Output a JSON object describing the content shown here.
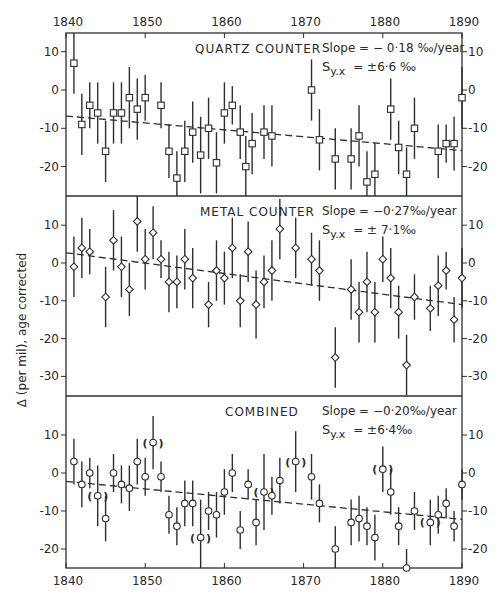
{
  "ylabel": "Δ (per mil), age corrected",
  "x_ticks_top": [
    "1840",
    "1850",
    "1860",
    "1870",
    "1880",
    "1890"
  ],
  "x_ticks_bottom": [
    "1840",
    "1850",
    "1860",
    "1870",
    "1880",
    "1890"
  ],
  "chart_data": [
    {
      "type": "scatter",
      "title": "QUARTZ COUNTER",
      "xlabel": "Year",
      "ylabel": "Δ (per mil), age corrected",
      "xlim": [
        1840,
        1890
      ],
      "ylim": [
        -27,
        15
      ],
      "yticks": [
        10,
        0,
        -10,
        -20
      ],
      "marker": "square",
      "annotations": [
        "Slope = -0·18‰/year",
        "S y.x = ±6·6‰"
      ],
      "slope_label": "Slope = − 0·18 ‰/year",
      "syx_label": "= ±6·6 ‰",
      "trend": {
        "x": [
          1840,
          1890
        ],
        "y": [
          -6.8,
          -15.8
        ]
      },
      "points": [
        {
          "x": 1841,
          "y": 7,
          "err": 8
        },
        {
          "x": 1842,
          "y": -9,
          "err": 8
        },
        {
          "x": 1843,
          "y": -4,
          "err": 6
        },
        {
          "x": 1844,
          "y": -6,
          "err": 8
        },
        {
          "x": 1845,
          "y": -16,
          "err": 8
        },
        {
          "x": 1846,
          "y": -6,
          "err": 8
        },
        {
          "x": 1847,
          "y": -6,
          "err": 8
        },
        {
          "x": 1848,
          "y": -2,
          "err": 8
        },
        {
          "x": 1849,
          "y": -5,
          "err": 8
        },
        {
          "x": 1850,
          "y": -2,
          "err": 6
        },
        {
          "x": 1852,
          "y": -4,
          "err": 6
        },
        {
          "x": 1853,
          "y": -16,
          "err": 7
        },
        {
          "x": 1854,
          "y": -23,
          "err": 7
        },
        {
          "x": 1855,
          "y": -16,
          "err": 8
        },
        {
          "x": 1856,
          "y": -11,
          "err": 8
        },
        {
          "x": 1857,
          "y": -17,
          "err": 10
        },
        {
          "x": 1858,
          "y": -10,
          "err": 8
        },
        {
          "x": 1859,
          "y": -19,
          "err": 8
        },
        {
          "x": 1860,
          "y": -6,
          "err": 8
        },
        {
          "x": 1861,
          "y": -4,
          "err": 5
        },
        {
          "x": 1862,
          "y": -11,
          "err": 7
        },
        {
          "x": 1862.7,
          "y": -20,
          "err": 8
        },
        {
          "x": 1863.5,
          "y": -14,
          "err": 8
        },
        {
          "x": 1865,
          "y": -11,
          "err": 7
        },
        {
          "x": 1866,
          "y": -12,
          "err": 8
        },
        {
          "x": 1871,
          "y": 0,
          "err": 8
        },
        {
          "x": 1872,
          "y": -13,
          "err": 8
        },
        {
          "x": 1874,
          "y": -18,
          "err": 8
        },
        {
          "x": 1876,
          "y": -18,
          "err": 8
        },
        {
          "x": 1877,
          "y": -12,
          "err": 8
        },
        {
          "x": 1878,
          "y": -24,
          "err": 8
        },
        {
          "x": 1879,
          "y": -22,
          "err": 8
        },
        {
          "x": 1881,
          "y": -5,
          "err": 8
        },
        {
          "x": 1882,
          "y": -15,
          "err": 7
        },
        {
          "x": 1883,
          "y": -22,
          "err": 7
        },
        {
          "x": 1884,
          "y": -10,
          "err": 8
        },
        {
          "x": 1887,
          "y": -16,
          "err": 7
        },
        {
          "x": 1888,
          "y": -14,
          "err": 5
        },
        {
          "x": 1889,
          "y": -14,
          "err": 7
        },
        {
          "x": 1890,
          "y": -2,
          "err": 8
        }
      ]
    },
    {
      "type": "scatter",
      "title": "METAL COUNTER",
      "xlabel": "Year",
      "ylabel": "Δ (per mil), age corrected",
      "xlim": [
        1840,
        1890
      ],
      "ylim": [
        -35,
        17
      ],
      "yticks": [
        10,
        0,
        -10,
        -20,
        -30
      ],
      "marker": "diamond",
      "slope_label": "Slope = −0·27‰/year",
      "syx_label": "= ± 7·1‰",
      "trend": {
        "x": [
          1840,
          1890
        ],
        "y": [
          2.7,
          -11.0
        ]
      },
      "points": [
        {
          "x": 1841,
          "y": -1,
          "err": 8
        },
        {
          "x": 1842,
          "y": 4,
          "err": 8
        },
        {
          "x": 1843,
          "y": 3,
          "err": 6
        },
        {
          "x": 1845,
          "y": -9,
          "err": 8
        },
        {
          "x": 1846,
          "y": 6,
          "err": 8
        },
        {
          "x": 1847,
          "y": -1,
          "err": 8
        },
        {
          "x": 1848,
          "y": -7,
          "err": 7
        },
        {
          "x": 1849,
          "y": 11,
          "err": 8
        },
        {
          "x": 1850,
          "y": 1,
          "err": 8
        },
        {
          "x": 1851,
          "y": 8,
          "err": 7
        },
        {
          "x": 1852,
          "y": 1,
          "err": 5
        },
        {
          "x": 1853,
          "y": -5,
          "err": 8
        },
        {
          "x": 1854,
          "y": -5,
          "err": 7
        },
        {
          "x": 1855,
          "y": 1,
          "err": 8
        },
        {
          "x": 1856,
          "y": -4,
          "err": 8
        },
        {
          "x": 1858,
          "y": -11,
          "err": 6
        },
        {
          "x": 1859,
          "y": -2,
          "err": 8
        },
        {
          "x": 1860,
          "y": -4,
          "err": 7
        },
        {
          "x": 1861,
          "y": 4,
          "err": 8
        },
        {
          "x": 1862,
          "y": -10,
          "err": 7
        },
        {
          "x": 1863,
          "y": 3,
          "err": 8
        },
        {
          "x": 1864,
          "y": -11,
          "err": 9
        },
        {
          "x": 1865,
          "y": -5,
          "err": 7
        },
        {
          "x": 1866,
          "y": -2,
          "err": 8
        },
        {
          "x": 1867,
          "y": 9,
          "err": 8
        },
        {
          "x": 1869,
          "y": 4,
          "err": 8
        },
        {
          "x": 1871,
          "y": 1,
          "err": 7
        },
        {
          "x": 1872,
          "y": -2,
          "err": 8
        },
        {
          "x": 1874,
          "y": -25,
          "err": 8
        },
        {
          "x": 1876,
          "y": -7,
          "err": 8
        },
        {
          "x": 1877,
          "y": -13,
          "err": 8
        },
        {
          "x": 1878,
          "y": -5,
          "err": 8
        },
        {
          "x": 1879,
          "y": -13,
          "err": 8
        },
        {
          "x": 1880,
          "y": 1,
          "err": 6
        },
        {
          "x": 1881,
          "y": -4,
          "err": 8
        },
        {
          "x": 1882,
          "y": -13,
          "err": 7
        },
        {
          "x": 1883,
          "y": -27,
          "err": 8
        },
        {
          "x": 1884,
          "y": -9,
          "err": 6
        },
        {
          "x": 1886,
          "y": -12,
          "err": 6
        },
        {
          "x": 1887,
          "y": -6,
          "err": 8
        },
        {
          "x": 1888,
          "y": -2,
          "err": 5
        },
        {
          "x": 1889,
          "y": -15,
          "err": 6
        },
        {
          "x": 1890,
          "y": -4,
          "err": 8
        }
      ]
    },
    {
      "type": "scatter",
      "title": "COMBINED",
      "xlabel": "Year",
      "ylabel": "Δ (per mil), age corrected",
      "xlim": [
        1840,
        1890
      ],
      "ylim": [
        -25,
        20
      ],
      "yticks": [
        10,
        0,
        -10,
        -20
      ],
      "xticks": [
        1840,
        1850,
        1860,
        1870,
        1880,
        1890
      ],
      "marker": "circle",
      "slope_label": "Slope = −0·20‰/year",
      "syx_label": "= ±6·4‰",
      "trend": {
        "x": [
          1840,
          1890
        ],
        "y": [
          -2.2,
          -12.2
        ]
      },
      "points": [
        {
          "x": 1841,
          "y": 3,
          "err": 6
        },
        {
          "x": 1842,
          "y": -3,
          "err": 6
        },
        {
          "x": 1843,
          "y": 0,
          "err": 4
        },
        {
          "x": 1844,
          "y": -6,
          "err": 8,
          "bracketed": true
        },
        {
          "x": 1845,
          "y": -12,
          "err": 6
        },
        {
          "x": 1846,
          "y": 0,
          "err": 5
        },
        {
          "x": 1847,
          "y": -3,
          "err": 5
        },
        {
          "x": 1848,
          "y": -4,
          "err": 6
        },
        {
          "x": 1849,
          "y": 3,
          "err": 6
        },
        {
          "x": 1850,
          "y": -1,
          "err": 5
        },
        {
          "x": 1851,
          "y": 8,
          "err": 7,
          "bracketed": true
        },
        {
          "x": 1852,
          "y": -1,
          "err": 4
        },
        {
          "x": 1853,
          "y": -11,
          "err": 5
        },
        {
          "x": 1854,
          "y": -14,
          "err": 5
        },
        {
          "x": 1855,
          "y": -8,
          "err": 6
        },
        {
          "x": 1856,
          "y": -8,
          "err": 6
        },
        {
          "x": 1857,
          "y": -17,
          "err": 10,
          "bracketed": true
        },
        {
          "x": 1858,
          "y": -10,
          "err": 5
        },
        {
          "x": 1859,
          "y": -11,
          "err": 6
        },
        {
          "x": 1860,
          "y": -5,
          "err": 6
        },
        {
          "x": 1861,
          "y": 0,
          "err": 5
        },
        {
          "x": 1862,
          "y": -15,
          "err": 5
        },
        {
          "x": 1863,
          "y": -3,
          "err": 4
        },
        {
          "x": 1864,
          "y": -13,
          "err": 6
        },
        {
          "x": 1865,
          "y": -5,
          "err": 10,
          "bracketed": true
        },
        {
          "x": 1866,
          "y": -6,
          "err": 5
        },
        {
          "x": 1867,
          "y": -2,
          "err": 6
        },
        {
          "x": 1869,
          "y": 3,
          "err": 8,
          "bracketed": true
        },
        {
          "x": 1871,
          "y": -1,
          "err": 6
        },
        {
          "x": 1872,
          "y": -8,
          "err": 5
        },
        {
          "x": 1874,
          "y": -20,
          "err": 6
        },
        {
          "x": 1876,
          "y": -13,
          "err": 6
        },
        {
          "x": 1877,
          "y": -12,
          "err": 6
        },
        {
          "x": 1878,
          "y": -14,
          "err": 5
        },
        {
          "x": 1879,
          "y": -17,
          "err": 6
        },
        {
          "x": 1880,
          "y": 1,
          "err": 6,
          "bracketed": true
        },
        {
          "x": 1881,
          "y": -5,
          "err": 6
        },
        {
          "x": 1882,
          "y": -14,
          "err": 5
        },
        {
          "x": 1883,
          "y": -25,
          "err": 5
        },
        {
          "x": 1884,
          "y": -10,
          "err": 5
        },
        {
          "x": 1886,
          "y": -13,
          "err": 6,
          "bracketed": true
        },
        {
          "x": 1887,
          "y": -11,
          "err": 5
        },
        {
          "x": 1888,
          "y": -8,
          "err": 4
        },
        {
          "x": 1889,
          "y": -14,
          "err": 4
        },
        {
          "x": 1890,
          "y": -3,
          "err": 4
        }
      ]
    }
  ]
}
